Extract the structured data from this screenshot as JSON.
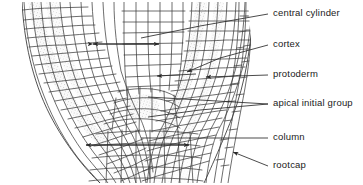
{
  "figure": {
    "background_color": "#ffffff",
    "line_color": "#3a3a3a",
    "stipple_color": "#d8d8d8",
    "text_color": "#1a1a1a",
    "width": 363,
    "height": 185
  },
  "labels": [
    {
      "id": "central-cylinder",
      "text": "central cylinder",
      "x": 273,
      "y": 10
    },
    {
      "id": "cortex",
      "text": "cortex",
      "x": 273,
      "y": 40
    },
    {
      "id": "protoderm",
      "text": "protoderm",
      "x": 273,
      "y": 70
    },
    {
      "id": "apical-initial",
      "text": "apical initial group",
      "x": 273,
      "y": 99
    },
    {
      "id": "column",
      "text": "column",
      "x": 273,
      "y": 133
    },
    {
      "id": "rootcap",
      "text": "rootcap",
      "x": 273,
      "y": 161
    }
  ],
  "measure_arrows": [
    {
      "id": "central-cylinder-width",
      "label": "central cylinder width",
      "x1": 92,
      "x2": 160,
      "y": 44
    },
    {
      "id": "column-width",
      "label": "column width",
      "x1": 85,
      "x2": 190,
      "y": 145
    }
  ],
  "leaders": [
    {
      "id": "leader-central-cylinder",
      "for": "central cylinder",
      "from_x": 268,
      "from_y": 14,
      "to_x": 140,
      "to_y": 38
    },
    {
      "id": "leader-cortex",
      "for": "cortex",
      "from_x": 268,
      "from_y": 45,
      "to_x": 186,
      "to_y": 73
    },
    {
      "id": "leader-protoderm",
      "for": "protoderm",
      "from_x": 268,
      "from_y": 75,
      "to_x": 205,
      "to_y": 77
    },
    {
      "id": "leader-apical-a",
      "for": "apical initial group",
      "from_x": 268,
      "from_y": 104,
      "to_x": 147,
      "to_y": 98
    },
    {
      "id": "leader-apical-b",
      "for": "apical initial group",
      "from_x": 268,
      "from_y": 104,
      "to_x": 147,
      "to_y": 116
    },
    {
      "id": "leader-column",
      "for": "column",
      "from_x": 268,
      "from_y": 138,
      "to_x": 140,
      "to_y": 138
    },
    {
      "id": "leader-rootcap",
      "for": "rootcap",
      "from_x": 268,
      "from_y": 166,
      "to_x": 232,
      "to_y": 152
    }
  ],
  "regions": [
    {
      "id": "protoderm-band-left",
      "name": "protoderm (left flank)",
      "shaded": true
    },
    {
      "id": "cortex-left",
      "name": "cortex (left flank)",
      "shaded": false
    },
    {
      "id": "central-cylinder",
      "name": "central cylinder",
      "shaded": false
    },
    {
      "id": "cortex-right",
      "name": "cortex (right flank)",
      "shaded": false
    },
    {
      "id": "protoderm-band-right",
      "name": "protoderm (right flank)",
      "shaded": true
    },
    {
      "id": "rootcap",
      "name": "rootcap",
      "shaded": false
    },
    {
      "id": "column",
      "name": "column",
      "shaded": false
    },
    {
      "id": "apical-initial-group",
      "name": "apical initial group",
      "shaded": true
    }
  ]
}
